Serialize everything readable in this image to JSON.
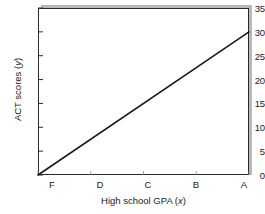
{
  "chart_data": {
    "type": "line",
    "title": "",
    "subtitle": "",
    "xlabel": "High school GPA (x)",
    "ylabel": "ACT scores (y)",
    "xlabel_text": "High school GPA (",
    "xlabel_var": "x",
    "xlabel_tail": ")",
    "ylabel_text": "ACT scores (",
    "ylabel_var": "y",
    "ylabel_tail": ")",
    "categories": [
      "F",
      "D",
      "C",
      "B",
      "A"
    ],
    "x": [
      0,
      1,
      2,
      3,
      4
    ],
    "series": [
      {
        "name": "ACT score trend",
        "points": [
          {
            "x": 0,
            "y": 0
          },
          {
            "x": 4,
            "y": 30
          }
        ],
        "values": [
          0,
          7.5,
          15,
          22.5,
          30
        ],
        "color": "#1a1a1a",
        "line_width": 1.6,
        "line_start_label": "F",
        "line_end_label": "A"
      }
    ],
    "xticks": [
      "F",
      "D",
      "C",
      "B",
      "A"
    ],
    "yticks": [
      0,
      5,
      10,
      15,
      20,
      25,
      30,
      35
    ],
    "ytick_labels": [
      "0",
      "5",
      "10",
      "15",
      "20",
      "25",
      "30",
      "35"
    ],
    "ylim": [
      0,
      35
    ],
    "xlim": [
      0,
      4
    ],
    "grid": false,
    "legend": false,
    "legend_position": "none",
    "frame_color": "#2b2b2b",
    "shadow_color": "#b9b9b9",
    "background": "#ffffff"
  },
  "figure": {
    "name": "act-scores-vs-gpa-line-chart",
    "width": 265,
    "height": 214
  }
}
